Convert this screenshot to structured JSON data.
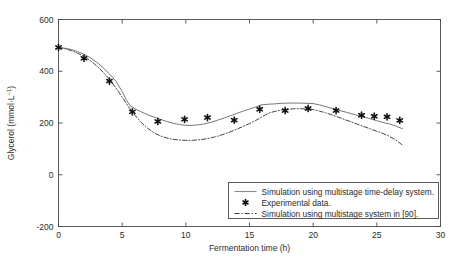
{
  "chart_data": {
    "type": "line",
    "title": "",
    "xlabel": "Fermentation time (h)",
    "ylabel": "Glycerol (mmol·L⁻¹)",
    "ylabel_base": "Glycerol (mmol·L",
    "ylabel_exp": "−1",
    "ylabel_tail": ")",
    "xlim": [
      0,
      30
    ],
    "ylim": [
      -200,
      600
    ],
    "xticks": [
      0,
      5,
      10,
      15,
      20,
      25,
      30
    ],
    "xticklabels": [
      "0",
      "5",
      "10",
      "15",
      "20",
      "25",
      "30"
    ],
    "yticks": [
      -200,
      0,
      200,
      400,
      600
    ],
    "yticklabels": [
      "-200",
      "0",
      "200",
      "400",
      "600"
    ],
    "grid": false,
    "box": true,
    "legend_position": "lower right",
    "series": [
      {
        "name": "Simulation using multistage time-delay system.",
        "type": "line",
        "style": "solid",
        "color": "#6f6f6f",
        "x": [
          0.0,
          0.5,
          1.0,
          1.5,
          2.0,
          2.5,
          3.0,
          3.5,
          4.0,
          4.5,
          5.0,
          5.3,
          5.6,
          6.0,
          6.5,
          7.0,
          7.5,
          8.0,
          8.5,
          9.0,
          9.5,
          10.0,
          10.5,
          11.0,
          11.5,
          12.0,
          12.5,
          13.0,
          13.5,
          14.0,
          14.5,
          15.0,
          15.5,
          15.9,
          16.3,
          17.0,
          17.5,
          18.0,
          18.5,
          19.0,
          19.5,
          20.0,
          20.5,
          21.0,
          21.5,
          22.0,
          22.5,
          23.0,
          23.5,
          24.0,
          24.5,
          25.0,
          25.5,
          26.0,
          26.5,
          27.0
        ],
        "y": [
          492,
          489,
          484,
          476,
          466,
          452,
          435,
          414,
          390,
          362,
          322,
          292,
          268,
          255,
          243,
          232,
          223,
          214,
          206,
          199,
          194,
          191,
          191,
          193,
          197,
          203,
          211,
          219,
          228,
          237,
          246,
          254,
          262,
          270,
          272,
          274,
          276,
          277,
          277,
          277,
          276,
          275,
          270,
          263,
          256,
          249,
          243,
          236,
          229,
          223,
          216,
          209,
          202,
          196,
          188,
          178
        ]
      },
      {
        "name": "Simulation using multistage system in [90].",
        "type": "line",
        "style": "dashdot",
        "color": "#3a3a3a",
        "x": [
          0.0,
          0.5,
          1.0,
          1.5,
          2.0,
          2.5,
          3.0,
          3.5,
          4.0,
          4.5,
          5.0,
          5.5,
          6.0,
          6.5,
          7.0,
          7.5,
          8.0,
          8.5,
          9.0,
          9.5,
          10.0,
          10.5,
          11.0,
          11.5,
          12.0,
          12.5,
          13.0,
          13.5,
          14.0,
          14.5,
          15.0,
          15.5,
          15.9,
          16.5,
          17.0,
          17.5,
          18.0,
          18.5,
          19.0,
          19.5,
          20.0,
          20.5,
          21.0,
          21.5,
          22.0,
          22.5,
          23.0,
          23.5,
          24.0,
          24.5,
          25.0,
          25.5,
          26.0,
          26.5,
          27.0
        ],
        "y": [
          492,
          487,
          480,
          470,
          457,
          441,
          421,
          397,
          369,
          336,
          300,
          263,
          230,
          202,
          180,
          162,
          150,
          142,
          137,
          134,
          133,
          133,
          135,
          138,
          143,
          149,
          157,
          166,
          176,
          187,
          198,
          210,
          222,
          238,
          245,
          250,
          253,
          255,
          255,
          255,
          252,
          246,
          239,
          231,
          222,
          213,
          204,
          195,
          186,
          177,
          168,
          159,
          148,
          134,
          115
        ]
      },
      {
        "name": "Experimental data.",
        "type": "scatter",
        "marker": "hexagram",
        "color": "#111111",
        "x": [
          0.0,
          2.0,
          4.0,
          5.8,
          7.8,
          9.9,
          11.7,
          13.8,
          15.8,
          17.8,
          19.6,
          21.8,
          23.8,
          24.8,
          25.8,
          26.8
        ],
        "y": [
          492,
          450,
          362,
          243,
          206,
          214,
          221,
          211,
          253,
          248,
          256,
          248,
          230,
          226,
          224,
          210
        ]
      }
    ],
    "legend_entries": [
      {
        "label": "Simulation using multistage time-delay system.",
        "marker": "line-solid"
      },
      {
        "label": "Experimental data.",
        "marker": "hexagram"
      },
      {
        "label": "Simulation using multistage system in [90].",
        "marker": "line-dashdot"
      }
    ]
  }
}
